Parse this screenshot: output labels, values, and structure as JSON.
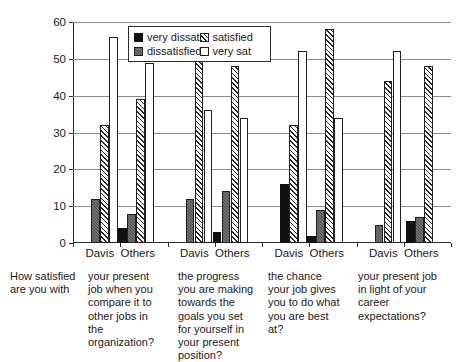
{
  "chart_data": {
    "type": "bar",
    "title": "",
    "subtitle": "",
    "xlabel": "",
    "ylabel": "",
    "ylim": [
      0,
      60
    ],
    "yticks": [
      0,
      10,
      20,
      30,
      40,
      50,
      60
    ],
    "grid": true,
    "legend_position": "top-center-inside",
    "orientation": "vertical",
    "grouping": "clustered",
    "legend": [
      "very dissat",
      "dissatisfied",
      "satisfied",
      "very sat"
    ],
    "series": [
      {
        "name": "very dissat",
        "color": "#111111",
        "values": [
          0,
          4,
          0,
          3,
          16,
          2,
          0,
          6
        ]
      },
      {
        "name": "dissatisfied",
        "color": "#4a4a4a",
        "values": [
          12,
          8,
          12,
          14,
          0,
          9,
          5,
          7
        ]
      },
      {
        "name": "satisfied",
        "color": "#ffffff",
        "pattern": "diagonal-hatch",
        "values": [
          32,
          39,
          52,
          48,
          32,
          58,
          44,
          48
        ]
      },
      {
        "name": "very sat",
        "color": "#ffffff",
        "values": [
          56,
          49,
          36,
          34,
          52,
          34,
          52,
          0
        ]
      }
    ],
    "categories": [
      "Davis",
      "Others",
      "Davis",
      "Others",
      "Davis",
      "Others",
      "Davis",
      "Others"
    ],
    "groups": [
      {
        "caption": "your present job when you compare it to other jobs in the organization?",
        "subcategories": [
          "Davis",
          "Others"
        ]
      },
      {
        "caption": "the progress you are making towards the goals you set for yourself in your present position?",
        "subcategories": [
          "Davis",
          "Others"
        ]
      },
      {
        "caption": "the chance your job gives you to do what you are best at?",
        "subcategories": [
          "Davis",
          "Others"
        ]
      },
      {
        "caption": "your present job in light of your career expectations?",
        "subcategories": [
          "Davis",
          "Others"
        ]
      }
    ],
    "stem_caption": "How satisfied are you with"
  },
  "axis": {
    "y_tick_labels": [
      "60",
      "50",
      "40",
      "30",
      "20",
      "10",
      "0"
    ]
  },
  "legend": {
    "items": [
      {
        "label": "very dissat",
        "swatch": "very-dissat"
      },
      {
        "label": "satisfied",
        "swatch": "satisfied"
      },
      {
        "label": "dissatisfied",
        "swatch": "dissatisfied"
      },
      {
        "label": "very sat",
        "swatch": "very-sat"
      }
    ]
  },
  "xlabels": {
    "group_pairs": [
      "Davis  Others",
      "Davis  Others",
      "Davis  Others",
      "Davis  Others"
    ]
  },
  "captions": {
    "stem": "How satisfied are you with",
    "columns": [
      "your present job when you compare it to other jobs in the organization?",
      "the progress you are making towards the goals you set for yourself in your present position?",
      "the chance your job gives you to do what you are best at?",
      "your present job in light of your career expectations?"
    ]
  },
  "colors": {
    "axis": "#2b2b2b",
    "grid": "#8a8a8a",
    "very_dissat": "#111111",
    "dissatisfied": "#4a4a4a",
    "satisfied_fill": "#ffffff",
    "very_sat": "#ffffff",
    "background": "#ffffff"
  }
}
